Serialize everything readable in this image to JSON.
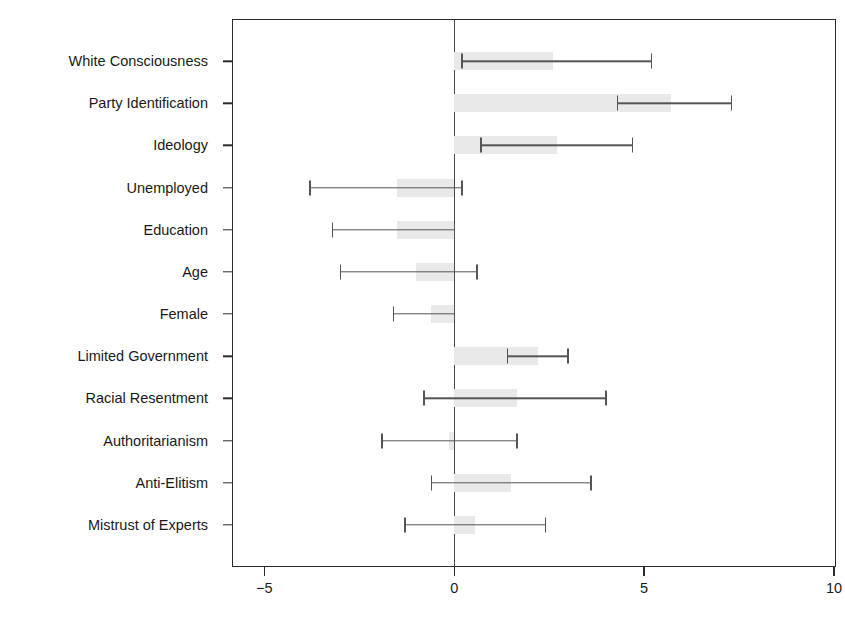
{
  "chart_data": {
    "type": "bar",
    "orientation": "horizontal",
    "title": "",
    "subtitle": "",
    "xlabel": "",
    "ylabel": "",
    "xlim": [
      -5.85,
      10.05
    ],
    "ylim": [
      0,
      12
    ],
    "grid": false,
    "legend": null,
    "zero_reference_line": 0,
    "xticks": [
      -5,
      0,
      5,
      10
    ],
    "xtick_labels": [
      "−5",
      "0",
      "5",
      "10"
    ],
    "categories": [
      "White Consciousness",
      "Party Identification",
      "Ideology",
      "Unemployed",
      "Education",
      "Age",
      "Female",
      "Limited Government",
      "Racial Resentment",
      "Authoritarianism",
      "Anti-Elitism",
      "Mistrust of Experts"
    ],
    "values": [
      2.6,
      5.7,
      2.7,
      -1.5,
      -1.5,
      -1.0,
      -0.6,
      2.2,
      1.65,
      -0.15,
      1.5,
      0.55
    ],
    "error_low": [
      0.2,
      4.3,
      0.7,
      -3.8,
      -3.2,
      -3.0,
      -1.6,
      1.4,
      -0.8,
      -1.9,
      -0.6,
      -1.3
    ],
    "error_high": [
      5.2,
      7.3,
      4.7,
      0.2,
      0.0,
      0.6,
      0.0,
      3.0,
      4.0,
      1.65,
      3.6,
      2.4
    ],
    "bar_color": "#e9e9e9",
    "error_color": "#555555",
    "axis_color": "#2b2b2b"
  }
}
